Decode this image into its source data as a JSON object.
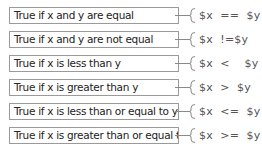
{
  "rows": [
    {
      "description": "True if x and y are equal",
      "code": "$x  ==  $y"
    },
    {
      "description": "True if x and y are not equal",
      "code": "$x  !=$y"
    },
    {
      "description": "True if x is less than y",
      "code": "$x  <    $y"
    },
    {
      "description": "True if x is greater than y",
      "code": "$x  >  $y"
    },
    {
      "description": "True if x is less than or equal to y",
      "code": "$x  <=  $y"
    },
    {
      "description": "True if x is greater than or equal to y",
      "code": "$x  >=  $y"
    }
  ],
  "colors": {
    "border": "#9a9a9a",
    "connector": "#8a8a8a",
    "text": "#222222",
    "code": "#555555"
  }
}
